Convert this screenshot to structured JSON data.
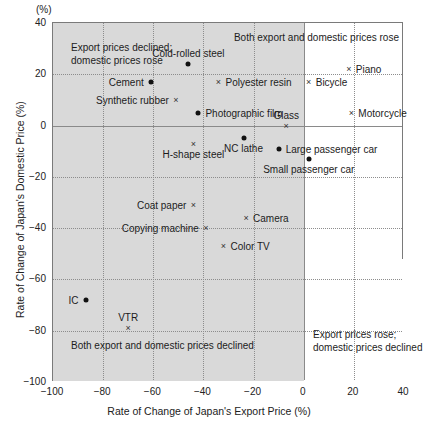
{
  "chart_data": {
    "type": "scatter",
    "title": "",
    "xlabel": "Rate of Change of Japan's Export Price (%)",
    "ylabel": "Rate of Change of Japan's Domestic Price (%)",
    "unit_marker": "(%)",
    "xlim": [
      -100,
      40
    ],
    "ylim": [
      -100,
      40
    ],
    "xticks": [
      -100,
      -80,
      -60,
      -40,
      -20,
      0,
      20,
      40
    ],
    "xtick_labels": [
      "-100",
      "-80",
      "-60",
      "-40",
      "-20",
      "0",
      "20",
      "40"
    ],
    "yticks": [
      -100,
      -80,
      -60,
      -40,
      -20,
      0,
      20,
      40
    ],
    "ytick_labels": [
      "-100",
      "-80",
      "-60",
      "-40",
      "-20",
      "0",
      "20",
      "40"
    ],
    "grid": true,
    "legend": "none",
    "marker_types": [
      "dot",
      "cross"
    ],
    "points": [
      {
        "label": "Cold-rolled steel",
        "x": -46,
        "y": 24,
        "marker": "dot",
        "label_pos": "above"
      },
      {
        "label": "Piano",
        "x": 18,
        "y": 22,
        "marker": "cross",
        "label_pos": "right"
      },
      {
        "label": "Cement",
        "x": -61,
        "y": 17,
        "marker": "dot",
        "label_pos": "left"
      },
      {
        "label": "Polyester resin",
        "x": -34,
        "y": 17,
        "marker": "cross",
        "label_pos": "right"
      },
      {
        "label": "Bicycle",
        "x": 2,
        "y": 17,
        "marker": "cross",
        "label_pos": "right"
      },
      {
        "label": "Synthetic rubber",
        "x": -51,
        "y": 10,
        "marker": "cross",
        "label_pos": "left"
      },
      {
        "label": "Photographic film",
        "x": -42,
        "y": 5,
        "marker": "dot",
        "label_pos": "right"
      },
      {
        "label": "Motorcycle",
        "x": 19,
        "y": 5,
        "marker": "cross",
        "label_pos": "right"
      },
      {
        "label": "Glass",
        "x": -7,
        "y": 0,
        "marker": "cross",
        "label_pos": "above"
      },
      {
        "label": "H-shape steel",
        "x": -44,
        "y": -7,
        "marker": "cross",
        "label_pos": "below"
      },
      {
        "label": "NC lathe",
        "x": -24,
        "y": -5,
        "marker": "dot",
        "label_pos": "below"
      },
      {
        "label": "Large passenger car",
        "x": -10,
        "y": -9,
        "marker": "dot",
        "label_pos": "right"
      },
      {
        "label": "Small passenger car",
        "x": 2,
        "y": -13,
        "marker": "dot",
        "label_pos": "below"
      },
      {
        "label": "Coat paper",
        "x": -44,
        "y": -31,
        "marker": "cross",
        "label_pos": "left"
      },
      {
        "label": "Camera",
        "x": -23,
        "y": -36,
        "marker": "cross",
        "label_pos": "right"
      },
      {
        "label": "Copying machine",
        "x": -39,
        "y": -40,
        "marker": "cross",
        "label_pos": "left"
      },
      {
        "label": "Color TV",
        "x": -32,
        "y": -47,
        "marker": "cross",
        "label_pos": "right"
      },
      {
        "label": "IC",
        "x": -87,
        "y": -68,
        "marker": "dot",
        "label_pos": "left"
      },
      {
        "label": "VTR",
        "x": -70,
        "y": -79,
        "marker": "cross",
        "label_pos": "above"
      }
    ],
    "quadrant_notes": [
      {
        "id": "top-left",
        "lines": [
          "Export prices declined;",
          "domestic prices rose"
        ]
      },
      {
        "id": "top-right",
        "lines": [
          "Both export and domestic prices rose"
        ]
      },
      {
        "id": "bottom-left",
        "lines": [
          "Both export and domestic prices declined"
        ]
      },
      {
        "id": "bottom-right",
        "lines": [
          "Export prices rose;",
          "domestic prices declined"
        ]
      }
    ],
    "colors": {
      "shade": "#d9d9d9",
      "marker": "#111111",
      "grid": "#8d8d8d",
      "frame": "#7a7a7a",
      "background": "#ffffff"
    }
  }
}
